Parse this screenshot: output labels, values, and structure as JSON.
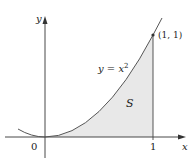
{
  "figure": {
    "axis_x_label": "x",
    "axis_y_label": "y",
    "origin_label": "0",
    "tick_x_label": "1",
    "curve_label_prefix": "y = x",
    "curve_label_exponent": "2",
    "point_label": "(1, 1)",
    "region_label": "S",
    "colors": {
      "axis": "#333333",
      "curve": "#555555",
      "region_fill": "#e8e8e8",
      "text": "#222222"
    }
  }
}
